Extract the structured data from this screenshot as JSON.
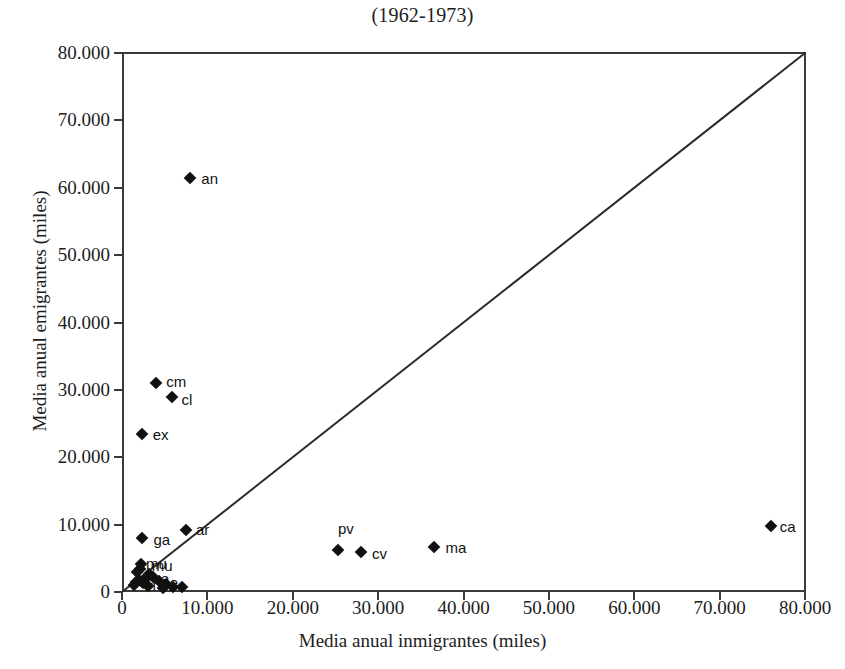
{
  "chart_data": {
    "type": "scatter",
    "title": "(1962-1973)",
    "xlabel": "Media anual inmigrantes (miles)",
    "ylabel": "Media anual emigrantes (miles)",
    "xlim": [
      0,
      80000
    ],
    "ylim": [
      0,
      80000
    ],
    "grid": false,
    "legend": "none",
    "xticks": [
      "0",
      "10.000",
      "20.000",
      "30.000",
      "40.000",
      "50.000",
      "60.000",
      "70.000",
      "80.000"
    ],
    "xtick_values": [
      0,
      10000,
      20000,
      30000,
      40000,
      50000,
      60000,
      70000,
      80000
    ],
    "yticks": [
      "0",
      "10.000",
      "20.000",
      "30.000",
      "40.000",
      "50.000",
      "60.000",
      "70.000",
      "80.000"
    ],
    "ytick_values": [
      0,
      10000,
      20000,
      30000,
      40000,
      50000,
      60000,
      70000,
      80000
    ],
    "reference_line": {
      "name": "diagonal-identity-line",
      "from": [
        0,
        0
      ],
      "to": [
        80000,
        80000
      ]
    },
    "marker": "diamond",
    "marker_color": "#111111",
    "axis_color": "#3a3a3a",
    "points": [
      {
        "label": "an",
        "x": 8000,
        "y": 61500,
        "label_dx": 11,
        "label_dy": 0
      },
      {
        "label": "cm",
        "x": 4000,
        "y": 31000,
        "label_dx": 10,
        "label_dy": -2
      },
      {
        "label": "cl",
        "x": 5800,
        "y": 28900,
        "label_dx": 10,
        "label_dy": 2
      },
      {
        "label": "ex",
        "x": 2300,
        "y": 23500,
        "label_dx": 11,
        "label_dy": 0
      },
      {
        "label": "ar",
        "x": 7500,
        "y": 9200,
        "label_dx": 10,
        "label_dy": -1
      },
      {
        "label": "ga",
        "x": 2400,
        "y": 8000,
        "label_dx": 11,
        "label_dy": 1
      },
      {
        "label": "pv",
        "x": 25300,
        "y": 6300,
        "label_dx": 0,
        "label_dy": -22
      },
      {
        "label": "cv",
        "x": 28000,
        "y": 6000,
        "label_dx": 11,
        "label_dy": 1
      },
      {
        "label": "ma",
        "x": 36500,
        "y": 6700,
        "label_dx": 12,
        "label_dy": 0
      },
      {
        "label": "ca",
        "x": 76000,
        "y": 9800,
        "label_dx": 9,
        "label_dy": 0
      },
      {
        "label": "mu",
        "x": 2200,
        "y": 4200,
        "label_dx": 11,
        "label_dy": 1
      },
      {
        "label": "ri",
        "x": 3200,
        "y": 2600,
        "label_dx": 0,
        "label_dy": 0
      },
      {
        "label": "na",
        "x": 3600,
        "y": 2200,
        "label_dx": 0,
        "label_dy": 0
      },
      {
        "label": "ba",
        "x": 2700,
        "y": 2000,
        "label_dx": 0,
        "label_dy": 0
      },
      {
        "label": "as",
        "x": 2000,
        "y": 1800,
        "label_dx": 0,
        "label_dy": 0
      },
      {
        "label": "cn",
        "x": 4300,
        "y": 1700,
        "label_dx": 0,
        "label_dy": 0
      },
      {
        "label": "ce",
        "x": 1600,
        "y": 1500,
        "label_dx": 0,
        "label_dy": 0
      },
      {
        "label": "me",
        "x": 2500,
        "y": 1300,
        "label_dx": 0,
        "label_dy": 0
      },
      {
        "label": "ar2",
        "x": 5200,
        "y": 1200,
        "label_dx": 0,
        "label_dy": 0
      },
      {
        "label": "lr",
        "x": 1400,
        "y": 1000,
        "label_dx": 0,
        "label_dy": 0
      },
      {
        "label": "so",
        "x": 3000,
        "y": 900,
        "label_dx": 0,
        "label_dy": 0
      },
      {
        "label": "hu",
        "x": 6000,
        "y": 800,
        "label_dx": 0,
        "label_dy": 0
      },
      {
        "label": "te",
        "x": 7000,
        "y": 700,
        "label_dx": 0,
        "label_dy": 0
      },
      {
        "label": "se",
        "x": 4800,
        "y": 600,
        "label_dx": 0,
        "label_dy": 0
      },
      {
        "label": "za",
        "x": 1800,
        "y": 2900,
        "label_dx": 0,
        "label_dy": 0
      },
      {
        "label": "pa",
        "x": 2100,
        "y": 3400,
        "label_dx": 0,
        "label_dy": 0
      }
    ],
    "cluster_labels": [
      {
        "text": "mu",
        "x": 2800,
        "y": 4300
      },
      {
        "text": "na",
        "x": 3600,
        "y": 2100
      },
      {
        "text": "ce",
        "x": 4700,
        "y": 1500
      },
      {
        "text": "ri",
        "x": 3000,
        "y": 1100
      }
    ]
  }
}
